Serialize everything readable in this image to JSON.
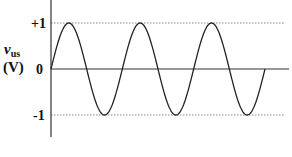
{
  "chart_data": {
    "type": "line",
    "title": "",
    "xlabel": "",
    "ylabel": "v_us (V)",
    "ylabel_main": "v",
    "ylabel_sub": "us",
    "ylabel_unit": "(V)",
    "yticks": [
      "+1",
      "0",
      "-1"
    ],
    "ylim": [
      -1,
      1
    ],
    "grid": "dotted reference lines at +1 and -1",
    "legend": null,
    "series": [
      {
        "name": "v_us",
        "function": "sine",
        "amplitude": 1,
        "cycles": 3,
        "x": [
          0,
          0.25,
          0.5,
          0.75,
          1,
          1.25,
          1.5,
          1.75,
          2,
          2.25,
          2.5,
          2.75,
          3
        ],
        "values": [
          0,
          1,
          0,
          -1,
          0,
          1,
          0,
          -1,
          0,
          1,
          0,
          -1,
          0
        ]
      }
    ],
    "colors": {
      "curve": "#222222",
      "axis": "#333333",
      "reference": "#888888"
    }
  }
}
